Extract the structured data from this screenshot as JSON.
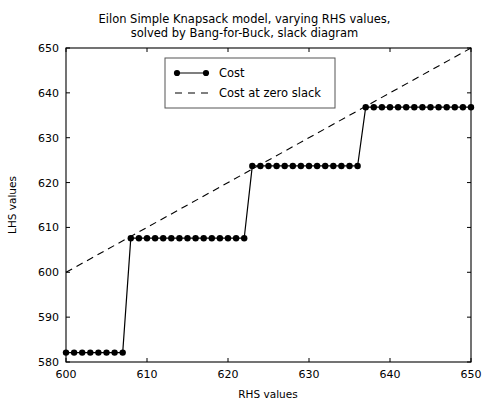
{
  "chart_data": {
    "type": "line",
    "xlabel": "RHS values",
    "ylabel": "LHS values",
    "xlim": [
      600,
      650
    ],
    "ylim": [
      580,
      650
    ],
    "xticks": [
      600,
      610,
      620,
      630,
      640,
      650
    ],
    "yticks": [
      580,
      590,
      600,
      610,
      620,
      630,
      640,
      650
    ],
    "grid": false,
    "legend_position": "upper center",
    "series": [
      {
        "name": "Cost",
        "style": "solid-with-markers",
        "color": "#000000",
        "marker": "circle",
        "x": [
          600,
          601,
          602,
          603,
          604,
          605,
          606,
          607,
          608,
          609,
          610,
          611,
          612,
          613,
          614,
          615,
          616,
          617,
          618,
          619,
          620,
          621,
          622,
          623,
          624,
          625,
          626,
          627,
          628,
          629,
          630,
          631,
          632,
          633,
          634,
          635,
          636,
          637,
          638,
          639,
          640,
          641,
          642,
          643,
          644,
          645,
          646,
          647,
          648,
          649,
          650
        ],
        "values": [
          582.1,
          582.1,
          582.1,
          582.1,
          582.1,
          582.1,
          582.1,
          582.1,
          607.6,
          607.6,
          607.6,
          607.6,
          607.6,
          607.6,
          607.6,
          607.6,
          607.6,
          607.6,
          607.6,
          607.6,
          607.6,
          607.6,
          607.6,
          623.7,
          623.7,
          623.7,
          623.7,
          623.7,
          623.7,
          623.7,
          623.7,
          623.7,
          623.7,
          623.7,
          623.7,
          623.7,
          623.7,
          636.8,
          636.8,
          636.8,
          636.8,
          636.8,
          636.8,
          636.8,
          636.8,
          636.8,
          636.8,
          636.8,
          636.8,
          636.8,
          636.8
        ]
      },
      {
        "name": "Cost at zero slack",
        "style": "dashed",
        "color": "#000000",
        "marker": "none",
        "x": [
          600,
          650
        ],
        "values": [
          600,
          650
        ]
      }
    ]
  },
  "legend": {
    "entries": [
      {
        "label": "Cost"
      },
      {
        "label": "Cost at zero slack"
      }
    ]
  },
  "axes": {
    "x_tick_labels": [
      "600",
      "610",
      "620",
      "630",
      "640",
      "650"
    ],
    "y_tick_labels": [
      "580",
      "590",
      "600",
      "610",
      "620",
      "630",
      "640",
      "650"
    ],
    "xlabel": "RHS values",
    "ylabel": "LHS values"
  },
  "title": {
    "line1": "Eilon Simple Knapsack model, varying RHS values,",
    "line2": "solved by Bang-for-Buck, slack diagram"
  },
  "colors": {
    "line": "#000000",
    "axis": "#000000",
    "background": "#ffffff"
  }
}
